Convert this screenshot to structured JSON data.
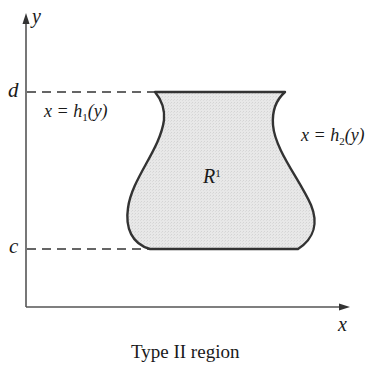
{
  "diagram": {
    "caption": "Type II region",
    "axes": {
      "x_label": "x",
      "y_label": "y"
    },
    "levels": {
      "upper": "d",
      "lower": "c"
    },
    "curves": {
      "left": {
        "lhs": "x = h",
        "subscript": "1",
        "rhs": "(y)"
      },
      "right": {
        "lhs": "x = h",
        "subscript": "2",
        "rhs": "(y)"
      }
    },
    "region": {
      "name": "R",
      "superscript": "1"
    },
    "colors": {
      "fill": "#e6e6e6",
      "stroke": "#333333",
      "axis": "#555555"
    }
  }
}
